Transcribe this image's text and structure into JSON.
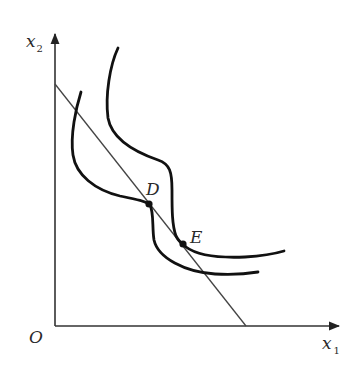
{
  "diagram": {
    "type": "indifference-curves-with-budget-line",
    "axes": {
      "x_label": "x",
      "x_subscript": "1",
      "y_label": "x",
      "y_subscript": "2",
      "origin_label": "O"
    },
    "budget_line": {
      "y_intercept_px": [
        55,
        84
      ],
      "x_intercept_px": [
        246,
        326
      ]
    },
    "curves": [
      {
        "name": "indifference-curve-inner",
        "through_point": "D"
      },
      {
        "name": "indifference-curve-outer",
        "through_point": "E"
      }
    ],
    "points": [
      {
        "label": "D",
        "x": 149,
        "y": 204
      },
      {
        "label": "E",
        "x": 183,
        "y": 244
      }
    ],
    "colors": {
      "curve": "#111111",
      "axis": "#333333",
      "line": "#444444",
      "background": "#ffffff"
    }
  }
}
